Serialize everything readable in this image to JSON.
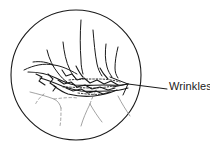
{
  "figure": {
    "type": "technical-illustration",
    "background_color": "#ffffff",
    "line_color": "#1a1a1a",
    "faint_line_color": "#8c8c8c",
    "callout": {
      "label": "Wrinkles",
      "label_x": 169,
      "label_y": 80,
      "leader_line": {
        "from_x": 128,
        "from_y": 84,
        "to_x": 167,
        "to_y": 89
      },
      "pointer_branches": [
        {
          "from_x": 128,
          "from_y": 84,
          "to_x": 112,
          "to_y": 78
        },
        {
          "from_x": 128,
          "from_y": 84,
          "to_x": 116,
          "to_y": 88
        },
        {
          "from_x": 128,
          "from_y": 84,
          "to_x": 124,
          "to_y": 94
        }
      ]
    },
    "detail_circle": {
      "center_x": 76,
      "center_y": 75,
      "radius": 65,
      "stroke_width": 1.1
    },
    "wrinkle_paths": [
      "M 42 95 C 50 88 60 84 70 83 C 82 82 96 84 108 82 C 116 81 124 82 130 84",
      "M 30 70 C 40 66 52 66 62 70 C 74 75 86 80 100 80",
      "M 46 52 C 50 62 56 70 64 76",
      "M 62 44 C 64 56 68 68 76 77",
      "M 80 22 C 80 40 80 58 82 74",
      "M 100 44 C 100 54 102 64 108 72",
      "M 116 46 C 114 56 112 64 110 72",
      "M 92 30 C 94 44 96 58 98 70"
    ],
    "faint_paths": [
      "M 36 96 C 44 98 52 100 58 104 C 62 108 64 116 64 124",
      "M 58 104 C 64 102 70 100 76 100",
      "M 88 104 C 92 112 96 118 100 122",
      "M 88 104 C 84 112 82 120 80 126"
    ]
  }
}
